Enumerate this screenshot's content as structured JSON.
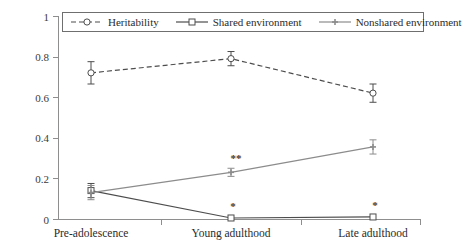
{
  "chart_data": {
    "type": "line",
    "title": "",
    "xlabel": "",
    "ylabel": "",
    "categories": [
      "Pre-adolescence",
      "Young adulthood",
      "Late adulthood"
    ],
    "ylim": [
      0,
      1
    ],
    "yticks": [
      "0",
      "0.2",
      "0.4",
      "0.6",
      "0.8",
      "1"
    ],
    "ytick_values": [
      0,
      0.2,
      0.4,
      0.6,
      0.8,
      1
    ],
    "grid": false,
    "legend_position": "top",
    "series": [
      {
        "name": "Heritability",
        "values": [
          0.72,
          0.79,
          0.62
        ],
        "errors": [
          0.055,
          0.035,
          0.045
        ],
        "line_style": "dashed",
        "marker": "open-circle",
        "color": "#4d4d4d"
      },
      {
        "name": "Shared environment",
        "values": [
          0.14,
          0.005,
          0.01
        ],
        "errors": [
          0.035,
          0.0,
          0.0
        ],
        "line_style": "solid",
        "marker": "open-square",
        "color": "#4d4d4d"
      },
      {
        "name": "Nonshared environment",
        "values": [
          0.13,
          0.23,
          0.355
        ],
        "errors": [
          0.035,
          0.02,
          0.035
        ],
        "line_style": "solid",
        "marker": "small-cross",
        "color": "#8c8c8c"
      }
    ],
    "annotations": [
      {
        "text": "**",
        "series": "Nonshared environment",
        "category": "Young adulthood",
        "x": 236,
        "y": 158
      },
      {
        "text": "*",
        "series": "Shared environment",
        "category": "Young adulthood",
        "x": 233,
        "y": 206
      },
      {
        "text": "*",
        "series": "Shared environment",
        "category": "Late adulthood",
        "x": 375,
        "y": 205
      }
    ]
  },
  "legend": {
    "entries": [
      {
        "label": "Heritability",
        "swatch": "dashed-open-circle"
      },
      {
        "label": "Shared environment",
        "swatch": "solid-open-square"
      },
      {
        "label": "Nonshared environment",
        "swatch": "solid-small-cross"
      }
    ]
  }
}
